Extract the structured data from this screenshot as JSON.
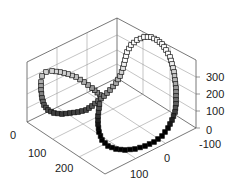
{
  "chart_data": {
    "type": "scatter3d",
    "title": "",
    "xlabel": "",
    "ylabel": "",
    "zlabel": "",
    "grid": true,
    "marker": "square",
    "marker_fill_gradient": [
      "#ffffff",
      "#000000"
    ],
    "x_ticks": [
      "0",
      "100",
      "200"
    ],
    "y_ticks": [
      "-100",
      "0",
      "100"
    ],
    "z_ticks": [
      "0",
      "100",
      "200",
      "300"
    ],
    "xlim": [
      0,
      250
    ],
    "ylim": [
      -100,
      150
    ],
    "zlim": [
      0,
      350
    ],
    "series": [
      {
        "name": "curve",
        "points_note": "approximate path in screen order",
        "x": [
          50,
          30,
          15,
          10,
          15,
          30,
          55,
          80,
          110,
          140,
          170,
          200,
          220,
          235,
          240,
          235,
          220,
          195,
          165,
          130,
          100,
          75,
          55,
          45,
          50
        ],
        "y": [
          0,
          30,
          60,
          85,
          100,
          105,
          100,
          85,
          60,
          30,
          0,
          -30,
          -60,
          -85,
          -100,
          -105,
          -100,
          -85,
          -60,
          -30,
          0,
          20,
          10,
          5,
          0
        ],
        "z": [
          120,
          160,
          200,
          240,
          270,
          280,
          260,
          220,
          170,
          110,
          60,
          20,
          5,
          0,
          5,
          30,
          80,
          140,
          200,
          260,
          300,
          320,
          290,
          210,
          120
        ]
      }
    ]
  },
  "axes": {
    "x_tick_labels": [
      "0",
      "100",
      "200"
    ],
    "y_tick_labels": [
      "-100",
      "0",
      "100"
    ],
    "z_tick_labels": [
      "0",
      "100",
      "200",
      "300"
    ]
  }
}
